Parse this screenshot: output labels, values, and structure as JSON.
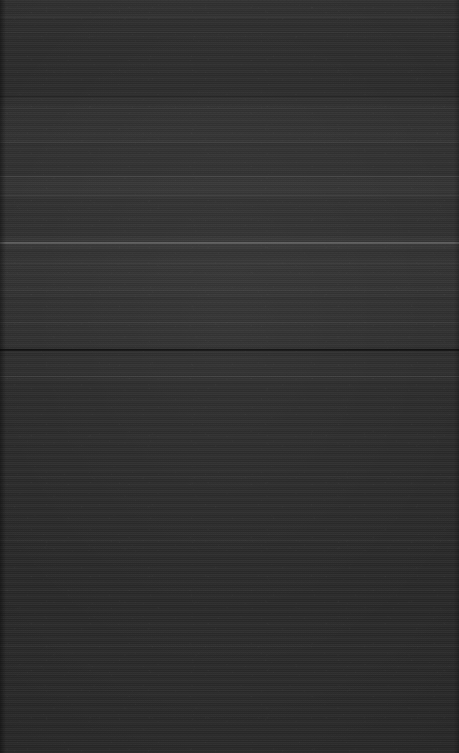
{
  "screen": {
    "label": "dark-blank-display",
    "description": "Near-black screen with faint horizontal scanline banding and several horizontal separator lines. No legible text, icons, or controls are visible.",
    "width_px": 459,
    "height_px": 753,
    "background_color": "#2a2a2a",
    "content_visible": false,
    "legible_text": ""
  },
  "appearance": {
    "base_color": "#2b2b2b",
    "lightest_color": "#6e6e6e",
    "darkest_color": "#111111",
    "texture": "horizontal-scanlines"
  },
  "bands": [
    {
      "name": "top-band",
      "top": 0,
      "height": 18,
      "tint": "rgba(255,255,255,0.012)"
    },
    {
      "name": "upper-band",
      "top": 95,
      "height": 48,
      "tint": "rgba(255,255,255,0.016)"
    },
    {
      "name": "mid-upper-band",
      "top": 178,
      "height": 18,
      "tint": "rgba(255,255,255,0.020)"
    },
    {
      "name": "highlight-band",
      "top": 236,
      "height": 14,
      "tint": "rgba(255,255,255,0.026)"
    },
    {
      "name": "mid-band",
      "top": 255,
      "height": 42,
      "tint": "rgba(255,255,255,0.014)"
    },
    {
      "name": "lower-mid-band",
      "top": 300,
      "height": 48,
      "tint": "rgba(255,255,255,0.012)"
    },
    {
      "name": "below-divider-band",
      "top": 356,
      "height": 26,
      "tint": "rgba(255,255,255,0.010)"
    },
    {
      "name": "bottom-band",
      "top": 620,
      "height": 133,
      "tint": "rgba(255,255,255,0.008)"
    }
  ],
  "rules": [
    {
      "name": "rule-top-edge",
      "top": 17,
      "height": 1,
      "color": "rgba(255,255,255,0.055)"
    },
    {
      "name": "rule-upper-a",
      "top": 32,
      "height": 1,
      "color": "rgba(255,255,255,0.040)"
    },
    {
      "name": "rule-upper-b",
      "top": 96,
      "height": 1,
      "color": "rgba(0,0,0,0.30)"
    },
    {
      "name": "rule-upper-c",
      "top": 108,
      "height": 1,
      "color": "rgba(255,255,255,0.045)"
    },
    {
      "name": "rule-upper-d",
      "top": 142,
      "height": 1,
      "color": "rgba(255,255,255,0.035)"
    },
    {
      "name": "rule-separator-1",
      "top": 176,
      "height": 1,
      "color": "rgba(255,255,255,0.090)"
    },
    {
      "name": "rule-separator-2",
      "top": 195,
      "height": 1,
      "color": "rgba(255,255,255,0.070)"
    },
    {
      "name": "rule-highlight",
      "top": 242,
      "height": 2,
      "color": "rgba(255,255,255,0.200)"
    },
    {
      "name": "rule-mid-a",
      "top": 263,
      "height": 1,
      "color": "rgba(255,255,255,0.060)"
    },
    {
      "name": "rule-mid-b",
      "top": 290,
      "height": 1,
      "color": "rgba(255,255,255,0.040)"
    },
    {
      "name": "rule-mid-c",
      "top": 322,
      "height": 1,
      "color": "rgba(255,255,255,0.045)"
    },
    {
      "name": "rule-divider-dark",
      "top": 349,
      "height": 2,
      "color": "rgba(0,0,0,0.62)"
    },
    {
      "name": "rule-below-divider",
      "top": 376,
      "height": 1,
      "color": "rgba(255,255,255,0.085)"
    },
    {
      "name": "rule-lower-a",
      "top": 437,
      "height": 1,
      "color": "rgba(255,255,255,0.022)"
    },
    {
      "name": "rule-lower-b",
      "top": 476,
      "height": 1,
      "color": "rgba(255,255,255,0.020)"
    },
    {
      "name": "rule-lower-c",
      "top": 540,
      "height": 1,
      "color": "rgba(255,255,255,0.018)"
    },
    {
      "name": "rule-lower-d",
      "top": 590,
      "height": 1,
      "color": "rgba(255,255,255,0.016)"
    },
    {
      "name": "rule-lower-e",
      "top": 646,
      "height": 1,
      "color": "rgba(255,255,255,0.020)"
    },
    {
      "name": "rule-lower-f",
      "top": 690,
      "height": 1,
      "color": "rgba(255,255,255,0.018)"
    },
    {
      "name": "rule-bottom-edge",
      "top": 740,
      "height": 1,
      "color": "rgba(255,255,255,0.015)"
    }
  ]
}
